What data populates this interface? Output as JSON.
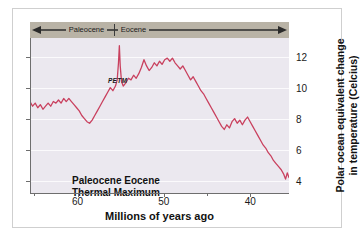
{
  "chart_data": {
    "type": "line",
    "title": "",
    "xlabel": "Millions of years ago",
    "ylabel_line1": "Polar ocean equivalent change",
    "ylabel_line2": "in temperature (Celcius)",
    "xlim": [
      65.5,
      35.5
    ],
    "ylim": [
      3.2,
      13.2
    ],
    "xticks": [
      60,
      50,
      40
    ],
    "xticklabels": [
      "60",
      "50",
      "40"
    ],
    "xticks_minor": [
      65,
      55,
      45
    ],
    "yticks": [
      4,
      6,
      8,
      10,
      12
    ],
    "yticklabels": [
      "4",
      "6",
      "8",
      "10",
      "12"
    ],
    "grid": "horizontal",
    "legend": "none",
    "line_color": "#c9405e",
    "plot_background": "#ebe8ef",
    "annotations": [
      {
        "name": "petm-spike-label",
        "text": "PETM",
        "x": 55.2,
        "y": 13.0
      },
      {
        "name": "thermal-maximum-label-line1",
        "text": "Paleocene Eocene",
        "x": 62.5,
        "y": 6.3
      },
      {
        "name": "thermal-maximum-label-line2",
        "text": "Thermal Maximum",
        "x": 62.5,
        "y": 5.6
      }
    ],
    "epoch_band": {
      "color": "#b9b3a6",
      "arrow_color": "#2b2b2b",
      "boundary_x": 55.8,
      "epochs": [
        {
          "name": "paleocene",
          "label": "Paleocene",
          "start": 65.5,
          "end": 55.8
        },
        {
          "name": "eocene",
          "label": "Eocene",
          "start": 55.8,
          "end": 35.5
        }
      ]
    },
    "series": [
      {
        "name": "polar-ocean-temperature",
        "x": [
          65.5,
          65.2,
          64.9,
          64.6,
          64.3,
          64.0,
          63.7,
          63.4,
          63.1,
          62.8,
          62.5,
          62.2,
          61.9,
          61.6,
          61.3,
          61.0,
          60.7,
          60.4,
          60.1,
          59.8,
          59.5,
          59.2,
          58.9,
          58.6,
          58.3,
          58.0,
          57.7,
          57.4,
          57.1,
          56.8,
          56.5,
          56.2,
          55.9,
          55.6,
          55.4,
          55.25,
          55.15,
          55.05,
          54.9,
          54.7,
          54.4,
          54.1,
          53.8,
          53.5,
          53.2,
          52.9,
          52.6,
          52.3,
          52.0,
          51.7,
          51.4,
          51.1,
          50.8,
          50.5,
          50.2,
          49.9,
          49.6,
          49.3,
          49.0,
          48.7,
          48.4,
          48.1,
          47.8,
          47.5,
          47.2,
          46.9,
          46.6,
          46.3,
          46.0,
          45.7,
          45.4,
          45.1,
          44.8,
          44.5,
          44.2,
          43.9,
          43.6,
          43.3,
          43.0,
          42.7,
          42.4,
          42.1,
          41.8,
          41.5,
          41.2,
          40.9,
          40.6,
          40.3,
          40.0,
          39.7,
          39.4,
          39.1,
          38.8,
          38.5,
          38.2,
          37.9,
          37.6,
          37.3,
          37.0,
          36.7,
          36.4,
          36.1,
          35.9,
          35.7,
          35.5
        ],
        "y": [
          9.1,
          8.8,
          9.0,
          8.7,
          8.9,
          8.6,
          8.8,
          9.0,
          8.8,
          9.1,
          9.0,
          9.2,
          9.0,
          9.3,
          9.1,
          9.3,
          9.1,
          8.9,
          8.7,
          8.5,
          8.2,
          8.0,
          7.8,
          7.7,
          7.9,
          8.2,
          8.5,
          8.8,
          9.1,
          9.4,
          9.7,
          10.0,
          9.8,
          10.1,
          10.5,
          11.6,
          12.7,
          11.4,
          10.4,
          10.1,
          10.3,
          10.6,
          10.5,
          10.8,
          10.6,
          10.9,
          11.3,
          11.8,
          11.4,
          11.1,
          11.3,
          11.6,
          11.4,
          11.7,
          11.5,
          11.8,
          11.9,
          11.7,
          11.9,
          11.6,
          11.4,
          11.2,
          11.4,
          11.1,
          10.8,
          10.5,
          10.7,
          10.4,
          10.1,
          9.8,
          9.6,
          9.3,
          9.0,
          8.7,
          8.4,
          8.1,
          7.8,
          7.5,
          7.3,
          7.6,
          7.4,
          7.8,
          8.0,
          7.7,
          7.9,
          7.6,
          7.9,
          8.1,
          7.8,
          7.5,
          7.2,
          6.9,
          6.6,
          6.3,
          6.1,
          5.8,
          5.6,
          5.3,
          5.1,
          4.9,
          4.7,
          4.4,
          4.1,
          4.5,
          4.2
        ]
      }
    ]
  }
}
